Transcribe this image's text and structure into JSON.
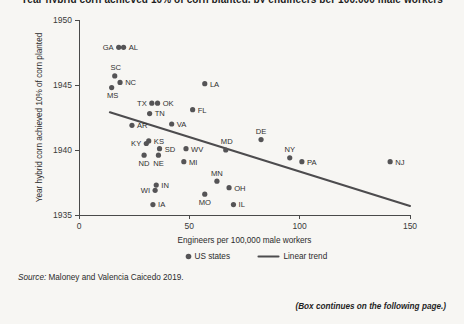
{
  "figure": {
    "title": "Year hybrid corn achieved 10% of corn planted, by engineers per 100,000 male workers",
    "source_prefix": "Source:",
    "source_text": " Maloney and Valencia Caicedo 2019.",
    "continues_note": "(Box continues on the following page.)"
  },
  "chart_data": {
    "type": "scatter",
    "title": "",
    "xlabel": "Engineers per 100,000 male workers",
    "ylabel": "Year hybrid corn achieved 10% of corn planted",
    "xlim": [
      0,
      150
    ],
    "ylim": [
      1935,
      1950
    ],
    "xticks": [
      0,
      50,
      100,
      150
    ],
    "xticklabels": [
      "0",
      "50",
      "100",
      "150"
    ],
    "yticks": [
      1935,
      1940,
      1945,
      1950
    ],
    "yticklabels": [
      "1935",
      "1940",
      "1945",
      "1950"
    ],
    "grid": false,
    "legend_position": "bottom",
    "series": [
      {
        "name": "US states",
        "type": "scatter",
        "marker_color": "#555456",
        "points": [
          {
            "label": "GA",
            "x": 18.0,
            "y": 1947.9,
            "label_pos": "left"
          },
          {
            "label": "AL",
            "x": 20.2,
            "y": 1947.9,
            "label_pos": "right"
          },
          {
            "label": "SC",
            "x": 16.2,
            "y": 1945.7,
            "label_pos": "above-left"
          },
          {
            "label": "NC",
            "x": 18.6,
            "y": 1945.2,
            "label_pos": "right"
          },
          {
            "label": "MS",
            "x": 14.8,
            "y": 1944.8,
            "label_pos": "below-left"
          },
          {
            "label": "TX",
            "x": 33.0,
            "y": 1943.6,
            "label_pos": "left"
          },
          {
            "label": "OK",
            "x": 35.6,
            "y": 1943.6,
            "label_pos": "right"
          },
          {
            "label": "LA",
            "x": 57.0,
            "y": 1945.1,
            "label_pos": "right"
          },
          {
            "label": "FL",
            "x": 51.5,
            "y": 1943.1,
            "label_pos": "right"
          },
          {
            "label": "TN",
            "x": 32.0,
            "y": 1942.8,
            "label_pos": "right"
          },
          {
            "label": "VA",
            "x": 42.0,
            "y": 1942.0,
            "label_pos": "right"
          },
          {
            "label": "AR",
            "x": 24.0,
            "y": 1941.9,
            "label_pos": "right"
          },
          {
            "label": "KY",
            "x": 30.5,
            "y": 1940.5,
            "label_pos": "left"
          },
          {
            "label": "KS",
            "x": 31.6,
            "y": 1940.7,
            "label_pos": "right"
          },
          {
            "label": "SD",
            "x": 36.5,
            "y": 1940.1,
            "label_pos": "right"
          },
          {
            "label": "ND",
            "x": 29.5,
            "y": 1939.6,
            "label_pos": "below"
          },
          {
            "label": "NE",
            "x": 36.0,
            "y": 1939.6,
            "label_pos": "below"
          },
          {
            "label": "WV",
            "x": 48.5,
            "y": 1940.1,
            "label_pos": "right"
          },
          {
            "label": "MI",
            "x": 47.5,
            "y": 1939.1,
            "label_pos": "right"
          },
          {
            "label": "MD",
            "x": 66.5,
            "y": 1940.0,
            "label_pos": "above-right"
          },
          {
            "label": "DE",
            "x": 82.5,
            "y": 1940.8,
            "label_pos": "above"
          },
          {
            "label": "NY",
            "x": 95.5,
            "y": 1939.4,
            "label_pos": "above"
          },
          {
            "label": "PA",
            "x": 101.0,
            "y": 1939.1,
            "label_pos": "right"
          },
          {
            "label": "NJ",
            "x": 141.0,
            "y": 1939.1,
            "label_pos": "right"
          },
          {
            "label": "MN",
            "x": 62.5,
            "y": 1937.6,
            "label_pos": "above"
          },
          {
            "label": "OH",
            "x": 68.0,
            "y": 1937.1,
            "label_pos": "right"
          },
          {
            "label": "MO",
            "x": 57.0,
            "y": 1936.6,
            "label_pos": "below"
          },
          {
            "label": "IL",
            "x": 70.0,
            "y": 1935.8,
            "label_pos": "right"
          },
          {
            "label": "IN",
            "x": 35.0,
            "y": 1937.3,
            "label_pos": "right"
          },
          {
            "label": "WI",
            "x": 34.5,
            "y": 1936.9,
            "label_pos": "left"
          },
          {
            "label": "IA",
            "x": 33.5,
            "y": 1935.8,
            "label_pos": "right"
          }
        ]
      },
      {
        "name": "Linear trend",
        "type": "line",
        "color": "#4d4c4e",
        "x": [
          14.0,
          163.0
        ],
        "y": [
          1942.9,
          1935.0
        ]
      }
    ],
    "legend": [
      {
        "label": "US states",
        "marker": "dot",
        "color": "#555456"
      },
      {
        "label": "Linear trend",
        "marker": "line",
        "color": "#4d4c4e"
      }
    ]
  }
}
